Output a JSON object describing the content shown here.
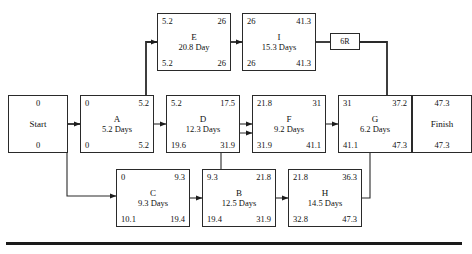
{
  "diagram": {
    "line_color": "#2a2a2a",
    "nodes": {
      "start": {
        "name": "Start",
        "early": "0",
        "late": "0"
      },
      "finish": {
        "name": "Finish",
        "early": "47.3",
        "late": "47.3"
      },
      "a": {
        "name": "A",
        "duration": "5.2 Days",
        "es": "0",
        "ef": "5.2",
        "ls": "0",
        "lf": "5.2"
      },
      "b": {
        "name": "B",
        "duration": "12.5 Days",
        "es": "9.3",
        "ef": "21.8",
        "ls": "19.4",
        "lf": "31.9"
      },
      "c": {
        "name": "C",
        "duration": "9.3 Days",
        "es": "0",
        "ef": "9.3",
        "ls": "10.1",
        "lf": "19.4"
      },
      "d": {
        "name": "D",
        "duration": "12.3 Days",
        "es": "5.2",
        "ef": "17.5",
        "ls": "19.6",
        "lf": "31.9"
      },
      "e": {
        "name": "E",
        "duration": "20.8 Day",
        "es": "5.2",
        "ef": "26",
        "ls": "5.2",
        "lf": "26"
      },
      "f": {
        "name": "F",
        "duration": "9.2 Days",
        "es": "21.8",
        "ef": "31",
        "ls": "31.9",
        "lf": "41.1"
      },
      "g": {
        "name": "G",
        "duration": "6.2 Days",
        "es": "31",
        "ef": "37.2",
        "ls": "41.1",
        "lf": "47.3"
      },
      "h": {
        "name": "H",
        "duration": "14.5 Days",
        "es": "21.8",
        "ef": "36.3",
        "ls": "32.8",
        "lf": "47.3"
      },
      "i": {
        "name": "I",
        "duration": "15.3 Days",
        "es": "26",
        "ef": "41.3",
        "ls": "26",
        "lf": "41.3"
      },
      "r6": {
        "name": "6R"
      }
    }
  }
}
